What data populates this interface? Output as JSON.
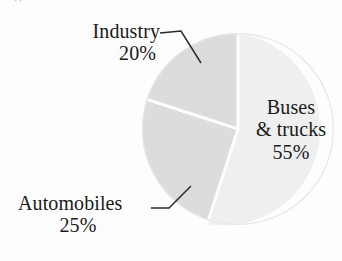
{
  "figure": {
    "background_color": "#fdfdfd",
    "text_color": "#1a1a1a",
    "cropped_caption_fragment": "p"
  },
  "labels": {
    "industry": {
      "name": "Industry",
      "percent": "20%"
    },
    "automobiles": {
      "name": "Automobiles",
      "percent": "25%"
    },
    "buses": {
      "line1": "Buses",
      "line2": "& trucks",
      "percent": "55%"
    }
  },
  "chart_data": {
    "type": "pie",
    "title": "",
    "subtitle": "",
    "xlabel": "",
    "ylabel": "",
    "grid": false,
    "legend_position": "none",
    "label_style": "callout-with-leader-lines",
    "units": "percent",
    "total": 100,
    "categories": [
      "Buses & trucks",
      "Automobiles",
      "Industry"
    ],
    "values": [
      55,
      25,
      20
    ],
    "slices": [
      {
        "label": "Buses & trucks",
        "value": 55,
        "value_text": "55%",
        "color": "#efefef",
        "start_angle_deg": 0,
        "end_angle_deg": 198,
        "label_placement": "inside"
      },
      {
        "label": "Automobiles",
        "value": 25,
        "value_text": "25%",
        "color": "#dcdcdc",
        "start_angle_deg": 198,
        "end_angle_deg": 288,
        "label_placement": "outside-left-lower"
      },
      {
        "label": "Industry",
        "value": 20,
        "value_text": "20%",
        "color": "#dcdcdc",
        "start_angle_deg": 288,
        "end_angle_deg": 360,
        "label_placement": "outside-left-upper"
      }
    ]
  }
}
